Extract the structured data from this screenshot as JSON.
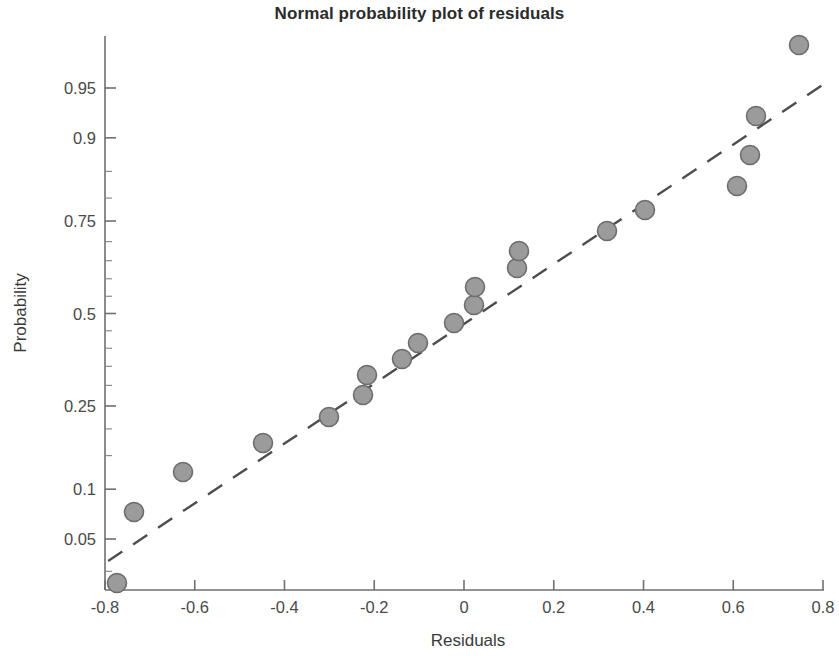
{
  "chart_data": {
    "type": "scatter",
    "title": "Normal probability plot of residuals",
    "xlabel": "Residuals",
    "ylabel": "Probability",
    "xlim": [
      -0.85,
      0.85
    ],
    "xticks": [
      -0.8,
      -0.6,
      -0.4,
      -0.2,
      0,
      0.2,
      0.4,
      0.6,
      0.8
    ],
    "xticklabels": [
      "-0.8",
      "-0.6",
      "-0.4",
      "-0.2",
      "0",
      "0.2",
      "0.4",
      "0.6",
      "0.8"
    ],
    "yscale": "normal-probability",
    "yticks": [
      0.05,
      0.1,
      0.25,
      0.5,
      0.75,
      0.9,
      0.95
    ],
    "yticklabels": [
      "0.05",
      "0.1",
      "0.25",
      "0.5",
      "0.75",
      "0.9",
      "0.95"
    ],
    "y_minor_ticks": [
      0.02,
      0.03,
      0.15,
      0.2,
      0.3,
      0.35,
      0.4,
      0.45,
      0.55,
      0.6,
      0.65,
      0.7,
      0.8,
      0.85,
      0.98
    ],
    "grid": false,
    "legend": null,
    "marker": {
      "shape": "circle",
      "fill": "#9b9b9b",
      "stroke": "#6d6d6d",
      "size_px": 19
    },
    "reference_line": {
      "style": "dashed",
      "color": "#4d4d4d",
      "x_start": -0.793,
      "y_start": 0.0355,
      "x_end": 0.798,
      "y_end": 0.952
    },
    "series": [
      {
        "name": "residuals",
        "n_points": 18,
        "x": [
          -0.793,
          -0.754,
          -0.641,
          -0.452,
          -0.307,
          -0.227,
          -0.218,
          -0.152,
          -0.107,
          -0.013,
          0.01,
          0.017,
          0.105,
          0.11,
          0.312,
          0.402,
          0.606,
          0.645,
          0.652,
          0.75
        ],
        "y": [
          0.028,
          0.08,
          0.135,
          0.195,
          0.228,
          0.268,
          0.322,
          0.38,
          0.432,
          0.478,
          0.518,
          0.558,
          0.618,
          0.668,
          0.728,
          0.775,
          0.812,
          0.872,
          0.922,
          0.978
        ]
      }
    ],
    "points": [
      {
        "x": -0.793,
        "y": 0.028,
        "px": 117,
        "py": 583
      },
      {
        "x": -0.754,
        "y": 0.08,
        "px": 134,
        "py": 512
      },
      {
        "x": -0.641,
        "y": 0.135,
        "px": 183,
        "py": 472
      },
      {
        "x": -0.452,
        "y": 0.195,
        "px": 263,
        "py": 443
      },
      {
        "x": -0.307,
        "y": 0.228,
        "px": 329,
        "py": 417
      },
      {
        "x": -0.227,
        "y": 0.268,
        "px": 363,
        "py": 395
      },
      {
        "x": -0.218,
        "y": 0.322,
        "px": 367,
        "py": 375
      },
      {
        "x": -0.152,
        "y": 0.38,
        "px": 402,
        "py": 359
      },
      {
        "x": -0.107,
        "y": 0.432,
        "px": 418,
        "py": 343
      },
      {
        "x": -0.013,
        "y": 0.478,
        "px": 454,
        "py": 323
      },
      {
        "x": 0.01,
        "y": 0.518,
        "px": 474,
        "py": 305
      },
      {
        "x": 0.017,
        "y": 0.558,
        "px": 475,
        "py": 287
      },
      {
        "x": 0.105,
        "y": 0.618,
        "px": 517,
        "py": 268
      },
      {
        "x": 0.11,
        "y": 0.668,
        "px": 519,
        "py": 251
      },
      {
        "x": 0.312,
        "y": 0.728,
        "px": 607,
        "py": 231
      },
      {
        "x": 0.402,
        "y": 0.775,
        "px": 645,
        "py": 210
      },
      {
        "x": 0.606,
        "y": 0.812,
        "px": 737,
        "py": 186
      },
      {
        "x": 0.645,
        "y": 0.872,
        "px": 750,
        "py": 155
      },
      {
        "x": 0.652,
        "y": 0.922,
        "px": 756,
        "py": 116
      },
      {
        "x": 0.75,
        "y": 0.978,
        "px": 799,
        "py": 45
      }
    ]
  },
  "axes": {
    "x_title": "Residuals",
    "y_title": "Probability"
  },
  "title": "Normal probability plot of residuals"
}
